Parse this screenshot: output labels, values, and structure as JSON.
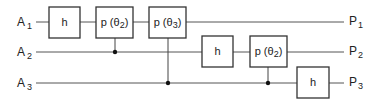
{
  "diagram": {
    "type": "quantum-circuit",
    "inputs": [
      {
        "name": "A",
        "sub": "1",
        "y": 22
      },
      {
        "name": "A",
        "sub": "2",
        "y": 52
      },
      {
        "name": "A",
        "sub": "3",
        "y": 83
      }
    ],
    "outputs": [
      {
        "name": "P",
        "sub": "1",
        "y": 22
      },
      {
        "name": "P",
        "sub": "2",
        "y": 52
      },
      {
        "name": "P",
        "sub": "3",
        "y": 83
      }
    ],
    "gates": [
      {
        "id": "g1",
        "label": "h",
        "wire": 1,
        "x": 49,
        "w": 31
      },
      {
        "id": "g2",
        "label_pre": "p (θ",
        "label_sub": "2",
        "label_post": ")",
        "wire": 1,
        "x": 96,
        "w": 37,
        "control_wire": 2
      },
      {
        "id": "g3",
        "label_pre": "p (θ",
        "label_sub": "3",
        "label_post": ")",
        "wire": 1,
        "x": 149,
        "w": 37,
        "control_wire": 3
      },
      {
        "id": "g4",
        "label": "h",
        "wire": 2,
        "x": 202,
        "w": 31
      },
      {
        "id": "g5",
        "label_pre": "p (θ",
        "label_sub": "2",
        "label_post": ")",
        "wire": 2,
        "x": 250,
        "w": 37,
        "control_wire": 3
      },
      {
        "id": "g6",
        "label": "h",
        "wire": 3,
        "x": 297,
        "w": 32
      }
    ]
  }
}
